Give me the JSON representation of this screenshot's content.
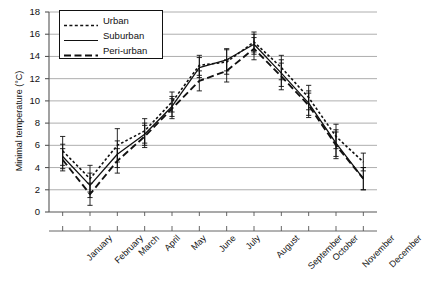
{
  "chart_data": {
    "type": "line",
    "title": "",
    "xlabel": "",
    "ylabel": "Minimal temperature (°C)",
    "ylim": [
      0,
      18
    ],
    "ytick_step": 2,
    "yticks": [
      0,
      2,
      4,
      6,
      8,
      10,
      12,
      14,
      16,
      18
    ],
    "grid": true,
    "grid_axis": "y",
    "legend_position": "upper-left",
    "error_bars": "vertical, capped",
    "categories": [
      "January",
      "February",
      "March",
      "April",
      "May",
      "June",
      "July",
      "August",
      "September",
      "October",
      "November",
      "December"
    ],
    "series": [
      {
        "name": "Urban",
        "line_style": "dotted",
        "values": [
          5.5,
          3.0,
          6.0,
          7.3,
          9.9,
          13.2,
          13.5,
          15.3,
          13.0,
          10.3,
          6.8,
          4.5
        ],
        "errors": [
          1.3,
          1.2,
          1.5,
          1.1,
          0.9,
          0.9,
          1.1,
          0.9,
          1.1,
          1.1,
          1.1,
          0.8
        ]
      },
      {
        "name": "Suburban",
        "line_style": "solid",
        "values": [
          5.0,
          2.4,
          5.2,
          7.0,
          9.5,
          13.0,
          13.7,
          15.1,
          12.5,
          9.8,
          6.2,
          3.0
        ],
        "errors": [
          1.1,
          1.1,
          1.2,
          1.0,
          0.9,
          0.9,
          1.0,
          0.9,
          1.2,
          1.1,
          1.2,
          1.0
        ]
      },
      {
        "name": "Peri-urban",
        "line_style": "dashed",
        "values": [
          4.7,
          1.6,
          4.6,
          6.8,
          9.3,
          11.8,
          12.7,
          14.7,
          12.2,
          9.6,
          6.0,
          3.0
        ],
        "errors": [
          1.0,
          1.0,
          1.1,
          1.0,
          0.9,
          0.9,
          1.0,
          1.0,
          1.2,
          1.1,
          1.2,
          1.0
        ]
      }
    ]
  },
  "legend": {
    "items": [
      {
        "label": "Urban"
      },
      {
        "label": "Suburban"
      },
      {
        "label": "Peri-urban"
      }
    ]
  },
  "colors": {
    "line": "#111111",
    "grid": "#999999",
    "axis": "#555555",
    "background": "#ffffff"
  }
}
